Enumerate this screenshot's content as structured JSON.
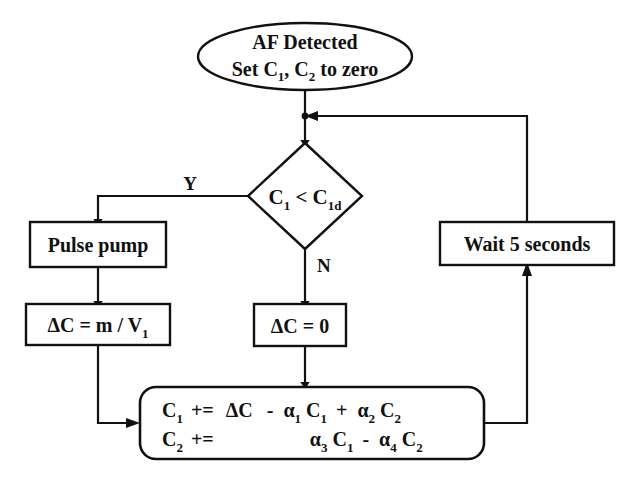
{
  "diagram": {
    "type": "flowchart",
    "title_visible": false,
    "colors": {
      "stroke": "#111111",
      "fill": "#ffffff",
      "background": "#ffffff"
    },
    "nodes": {
      "start": {
        "shape": "ellipse",
        "line1": "AF Detected",
        "line2_parts": {
          "set": "Set C",
          "sub1": "1",
          "comma": ", C",
          "sub2": "2",
          "tail": " to zero"
        },
        "line2_plain": "Set C1, C2 to zero"
      },
      "decision": {
        "shape": "diamond",
        "left": "C",
        "left_sub": "1",
        "operator": " < ",
        "right": "C",
        "right_sub": "1d",
        "plain": "C1 < C1d"
      },
      "pulse_pump": {
        "shape": "rect",
        "label": "Pulse pump"
      },
      "delta_c_pump": {
        "shape": "rect",
        "prefix": "ΔC  =  m  /  V",
        "sub": "1",
        "plain": "ΔC = m / V1"
      },
      "delta_c_zero": {
        "shape": "rect",
        "label": "ΔC  =  0",
        "plain": "ΔC = 0"
      },
      "wait": {
        "shape": "rect",
        "label": "Wait 5 seconds"
      },
      "update": {
        "shape": "rounded-rect",
        "row1": {
          "lhs": "C",
          "lhs_sub": "1",
          "op": "+=",
          "terms": [
            {
              "text": "ΔC",
              "sign": ""
            },
            {
              "sign": "-",
              "coef": "α",
              "coef_sub": "1",
              "var": "C",
              "var_sub": "1"
            },
            {
              "sign": "+",
              "coef": "α",
              "coef_sub": "2",
              "var": "C",
              "var_sub": "2"
            }
          ],
          "plain": "C1 += ΔC - α1 C1 + α2 C2"
        },
        "row2": {
          "lhs": "C",
          "lhs_sub": "2",
          "op": "+=",
          "terms": [
            {
              "sign": "",
              "coef": "α",
              "coef_sub": "3",
              "var": "C",
              "var_sub": "1"
            },
            {
              "sign": "-",
              "coef": "α",
              "coef_sub": "4",
              "var": "C",
              "var_sub": "2"
            }
          ],
          "plain": "C2 += α3 C1 - α4 C2"
        }
      }
    },
    "branch_labels": {
      "yes": "Y",
      "no": "N"
    }
  }
}
